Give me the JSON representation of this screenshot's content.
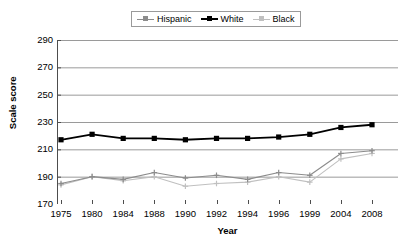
{
  "chart_data": {
    "type": "line",
    "title": "",
    "xlabel": "Year",
    "ylabel": "Scale score",
    "grid": true,
    "legend_position": "top-center",
    "categories": [
      "1975",
      "1980",
      "1984",
      "1988",
      "1990",
      "1992",
      "1994",
      "1996",
      "1999",
      "2004",
      "2008"
    ],
    "ylim": [
      170,
      290
    ],
    "yticks": [
      170,
      190,
      210,
      230,
      250,
      270,
      290
    ],
    "series": [
      {
        "name": "Hispanic",
        "color": "#8c8c8c",
        "marker": "cross",
        "values": [
          185,
          190,
          188,
          193,
          189,
          191,
          188,
          193,
          191,
          207,
          209
        ]
      },
      {
        "name": "White",
        "color": "#000000",
        "marker": "square",
        "values": [
          217,
          221,
          218,
          218,
          217,
          218,
          218,
          219,
          221,
          226,
          228
        ]
      },
      {
        "name": "Black",
        "color": "#c0c0c0",
        "marker": "cross",
        "values": [
          184,
          190,
          187,
          190,
          183,
          185,
          186,
          190,
          186,
          203,
          207
        ]
      }
    ]
  },
  "legend": {
    "items": [
      {
        "label": "Hispanic"
      },
      {
        "label": "White"
      },
      {
        "label": "Black"
      }
    ]
  },
  "axes": {
    "y_title": "Scale score",
    "x_title": "Year",
    "y_tick_labels": [
      "290",
      "270",
      "250",
      "230",
      "210",
      "190",
      "170"
    ],
    "x_tick_labels": [
      "1975",
      "1980",
      "1984",
      "1988",
      "1990",
      "1992",
      "1994",
      "1996",
      "1999",
      "2004",
      "2008"
    ]
  },
  "colors": {
    "grid": "#9a9a9a",
    "axis": "#4d4d4d",
    "hispanic": "#8c8c8c",
    "white_series": "#000000",
    "black_series": "#c0c0c0",
    "background": "#ffffff"
  }
}
